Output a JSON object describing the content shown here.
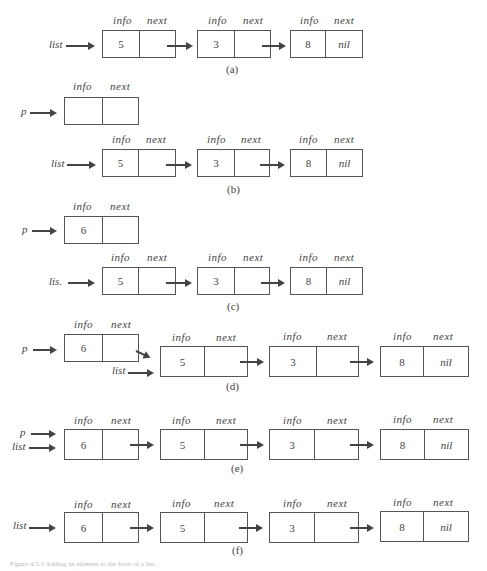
{
  "figure": {
    "field_labels": {
      "info": "info",
      "next": "next"
    },
    "panels": [
      {
        "id": "a",
        "caption": "(a)",
        "pointers": [
          "list"
        ],
        "nodes": [
          {
            "info": "5",
            "next": ""
          },
          {
            "info": "3",
            "next": ""
          },
          {
            "info": "8",
            "next": "nil"
          }
        ]
      },
      {
        "id": "b",
        "caption": "(b)",
        "pointers": [
          "p",
          "list"
        ],
        "p_node": {
          "info": "",
          "next": ""
        },
        "nodes": [
          {
            "info": "5",
            "next": ""
          },
          {
            "info": "3",
            "next": ""
          },
          {
            "info": "8",
            "next": "nil"
          }
        ]
      },
      {
        "id": "c",
        "caption": "(c)",
        "pointers": [
          "p",
          "lis."
        ],
        "p_node": {
          "info": "6",
          "next": ""
        },
        "nodes": [
          {
            "info": "5",
            "next": ""
          },
          {
            "info": "3",
            "next": ""
          },
          {
            "info": "8",
            "next": "nil"
          }
        ]
      },
      {
        "id": "d",
        "caption": "(d)",
        "pointers": [
          "p",
          "list"
        ],
        "p_node": {
          "info": "6",
          "next": ""
        },
        "nodes": [
          {
            "info": "5",
            "next": ""
          },
          {
            "info": "3",
            "next": ""
          },
          {
            "info": "8",
            "next": "nil"
          }
        ]
      },
      {
        "id": "e",
        "caption": "(e)",
        "pointers": [
          "p",
          "list"
        ],
        "nodes": [
          {
            "info": "6",
            "next": ""
          },
          {
            "info": "5",
            "next": ""
          },
          {
            "info": "3",
            "next": ""
          },
          {
            "info": "8",
            "next": "nil"
          }
        ]
      },
      {
        "id": "f",
        "caption": "(f)",
        "pointers": [
          "list"
        ],
        "nodes": [
          {
            "info": "6",
            "next": ""
          },
          {
            "info": "5",
            "next": ""
          },
          {
            "info": "3",
            "next": ""
          },
          {
            "info": "8",
            "next": "nil"
          }
        ]
      }
    ],
    "caption": "Figure 4.5.3 Adding an element to the front of a list."
  }
}
